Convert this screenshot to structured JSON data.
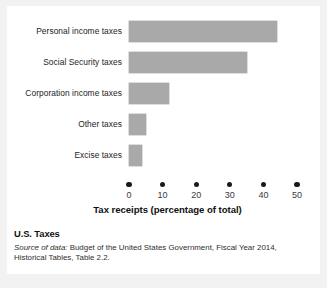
{
  "figure": {
    "cut_off_header": "",
    "caption_title": "U.S. Taxes",
    "source_lead": "Source of data:",
    "source_rest": " Budget of the United States Government, Fiscal Year 2014, Historical Tables, Table 2.2."
  },
  "chart_data": {
    "type": "bar",
    "orientation": "horizontal",
    "title": "",
    "xlabel": "Tax receipts (percentage of total)",
    "ylabel": "",
    "categories": [
      "Personal income taxes",
      "Social Security taxes",
      "Corporation income taxes",
      "Other taxes",
      "Excise taxes"
    ],
    "values": [
      44,
      35,
      12,
      5,
      4
    ],
    "xlim": [
      0,
      50
    ],
    "xticks": [
      0,
      10,
      20,
      30,
      40,
      50
    ],
    "xtick_labels": [
      "0",
      "10",
      "20",
      "30",
      "40",
      "50"
    ],
    "grid": false,
    "legend": false,
    "bar_color": "#a9a9a9",
    "axis_color": "#1b1b1b",
    "background": "#ffffff"
  }
}
